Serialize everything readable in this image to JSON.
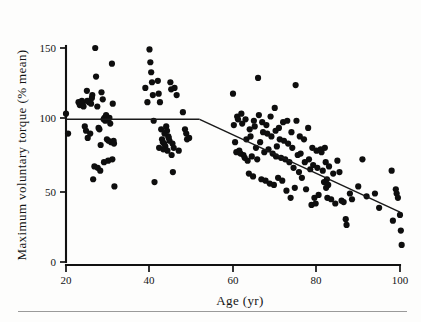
{
  "figure": {
    "background_color": "#fdfdfc",
    "ink_color": "#111111",
    "footer_rule": true
  },
  "axes": {
    "x_title": "Age (yr)",
    "y_title": "Maximum voluntary torque (% mean)",
    "x_ticks": [
      "20",
      "40",
      "60",
      "80",
      "100"
    ],
    "y_ticks": [
      "0",
      "50",
      "100",
      "150"
    ]
  },
  "chart_data": {
    "type": "scatter",
    "title": "",
    "xlabel": "Age (yr)",
    "ylabel": "Maximum voluntary torque (% mean)",
    "xlim": [
      20,
      100
    ],
    "ylim": [
      0,
      150
    ],
    "xticks": [
      20,
      40,
      60,
      80,
      100
    ],
    "yticks": [
      0,
      50,
      100,
      150
    ],
    "grid": false,
    "legend": null,
    "marker": {
      "shape": "filled-circle",
      "color": "#0e0e0e",
      "size": 3.1
    },
    "series": [
      {
        "name": "Maximum voluntary torque",
        "points": [
          [
            20,
            104
          ],
          [
            20.5,
            90
          ],
          [
            23,
            112
          ],
          [
            23.3,
            110
          ],
          [
            23.8,
            113
          ],
          [
            24,
            111
          ],
          [
            24.2,
            109
          ],
          [
            24.5,
            95
          ],
          [
            24.8,
            92
          ],
          [
            25,
            120
          ],
          [
            25.2,
            87
          ],
          [
            25.5,
            112
          ],
          [
            25.8,
            90
          ],
          [
            26,
            111
          ],
          [
            26.3,
            117
          ],
          [
            26.5,
            58
          ],
          [
            26.8,
            67
          ],
          [
            27,
            150
          ],
          [
            27.2,
            130
          ],
          [
            27.5,
            109
          ],
          [
            27.8,
            94
          ],
          [
            28,
            93
          ],
          [
            28.3,
            82
          ],
          [
            28.5,
            119
          ],
          [
            28.8,
            114
          ],
          [
            29,
            100
          ],
          [
            29.2,
            101
          ],
          [
            29.4,
            99
          ],
          [
            29.6,
            103
          ],
          [
            29.8,
            86
          ],
          [
            30,
            100
          ],
          [
            30.2,
            85
          ],
          [
            30.4,
            101
          ],
          [
            30.6,
            97
          ],
          [
            30.8,
            84
          ],
          [
            31,
            139
          ],
          [
            31.2,
            111
          ],
          [
            31.4,
            85
          ],
          [
            31.6,
            53
          ],
          [
            27.6,
            66
          ],
          [
            28.2,
            64
          ],
          [
            29.1,
            70
          ],
          [
            30.1,
            71
          ],
          [
            31.1,
            72
          ],
          [
            31.5,
            83
          ],
          [
            26.2,
            115
          ],
          [
            25.1,
            113
          ],
          [
            39,
            122
          ],
          [
            39.5,
            112
          ],
          [
            40,
            149
          ],
          [
            40.2,
            140
          ],
          [
            40.4,
            133
          ],
          [
            40.6,
            126
          ],
          [
            40.8,
            117
          ],
          [
            41,
            99
          ],
          [
            41.2,
            56
          ],
          [
            42,
            127
          ],
          [
            42.2,
            118
          ],
          [
            42.5,
            112
          ],
          [
            42.8,
            93
          ],
          [
            43,
            86
          ],
          [
            43.2,
            84
          ],
          [
            43.5,
            83
          ],
          [
            43.8,
            81
          ],
          [
            44,
            95
          ],
          [
            44.2,
            92
          ],
          [
            44.5,
            88
          ],
          [
            44.8,
            85
          ],
          [
            45,
            126
          ],
          [
            45.2,
            121
          ],
          [
            45.5,
            83
          ],
          [
            45.8,
            80
          ],
          [
            42.3,
            80
          ],
          [
            43.3,
            79
          ],
          [
            44.3,
            78
          ],
          [
            45.3,
            75
          ],
          [
            43.6,
            90
          ],
          [
            44.6,
            87
          ],
          [
            45.6,
            63
          ],
          [
            46,
            122
          ],
          [
            46.5,
            117
          ],
          [
            47,
            78
          ],
          [
            48,
            105
          ],
          [
            48.5,
            93
          ],
          [
            48.8,
            90
          ],
          [
            49,
            86
          ],
          [
            49.5,
            87
          ],
          [
            60,
            118
          ],
          [
            60.2,
            96
          ],
          [
            60.5,
            84
          ],
          [
            60.8,
            77
          ],
          [
            61,
            102
          ],
          [
            61.2,
            100
          ],
          [
            61.5,
            78
          ],
          [
            61.8,
            76
          ],
          [
            62,
            104
          ],
          [
            62.2,
            97
          ],
          [
            62.5,
            75
          ],
          [
            62.8,
            73
          ],
          [
            63,
            100
          ],
          [
            63.2,
            86
          ],
          [
            63.5,
            71
          ],
          [
            63.8,
            62
          ],
          [
            64,
            93
          ],
          [
            64.2,
            88
          ],
          [
            64.5,
            74
          ],
          [
            64.8,
            60
          ],
          [
            65,
            99
          ],
          [
            65.2,
            95
          ],
          [
            65.5,
            80
          ],
          [
            65.8,
            72
          ],
          [
            66,
            129
          ],
          [
            66.2,
            103
          ],
          [
            66.5,
            84
          ],
          [
            66.8,
            58
          ],
          [
            67,
            98
          ],
          [
            67.2,
            91
          ],
          [
            67.5,
            77
          ],
          [
            67.8,
            57
          ],
          [
            68,
            96
          ],
          [
            68.2,
            90
          ],
          [
            68.5,
            79
          ],
          [
            68.8,
            55
          ],
          [
            69,
            102
          ],
          [
            69.2,
            88
          ],
          [
            69.5,
            76
          ],
          [
            69.8,
            54
          ],
          [
            70,
            108
          ],
          [
            70.2,
            92
          ],
          [
            70.5,
            81
          ],
          [
            70.8,
            59
          ],
          [
            70.3,
            74
          ],
          [
            71,
            94
          ],
          [
            71.2,
            86
          ],
          [
            71.5,
            73
          ],
          [
            71.8,
            57
          ],
          [
            72,
            98
          ],
          [
            72.2,
            85
          ],
          [
            72.5,
            72
          ],
          [
            72.8,
            50
          ],
          [
            73,
            99
          ],
          [
            73.2,
            83
          ],
          [
            73.5,
            70
          ],
          [
            73.8,
            45
          ],
          [
            74,
            91
          ],
          [
            74.2,
            80
          ],
          [
            74.5,
            66
          ],
          [
            74.8,
            52
          ],
          [
            75,
            124
          ],
          [
            75.2,
            99
          ],
          [
            75.5,
            75
          ],
          [
            75.8,
            63
          ],
          [
            76,
            88
          ],
          [
            76.2,
            76
          ],
          [
            76.5,
            59
          ],
          [
            77,
            86
          ],
          [
            77.2,
            70
          ],
          [
            77.5,
            51
          ],
          [
            78,
            94
          ],
          [
            78.2,
            72
          ],
          [
            78.5,
            65
          ],
          [
            78.8,
            40
          ],
          [
            79,
            80
          ],
          [
            79.2,
            68
          ],
          [
            79.5,
            45
          ],
          [
            79.8,
            41
          ],
          [
            80,
            78
          ],
          [
            80.2,
            66
          ],
          [
            80.5,
            47
          ],
          [
            81,
            79
          ],
          [
            81.2,
            77
          ],
          [
            81.5,
            64
          ],
          [
            81.8,
            56
          ],
          [
            82,
            80
          ],
          [
            82.2,
            70
          ],
          [
            82.5,
            58
          ],
          [
            82.8,
            54
          ],
          [
            82.3,
            52
          ],
          [
            82.6,
            45
          ],
          [
            83,
            67
          ],
          [
            83.5,
            44
          ],
          [
            84,
            62
          ],
          [
            84.5,
            41
          ],
          [
            85,
            71
          ],
          [
            85.5,
            63
          ],
          [
            86,
            43
          ],
          [
            86.5,
            42
          ],
          [
            87,
            30
          ],
          [
            87.2,
            26
          ],
          [
            88,
            48
          ],
          [
            88.5,
            44
          ],
          [
            90,
            53
          ],
          [
            91,
            72
          ],
          [
            92,
            46
          ],
          [
            94,
            48
          ],
          [
            95,
            38
          ],
          [
            98,
            64
          ],
          [
            98.3,
            29
          ],
          [
            99,
            51
          ],
          [
            99.2,
            48
          ],
          [
            99.5,
            45
          ],
          [
            100,
            33
          ],
          [
            100.2,
            22
          ],
          [
            100.4,
            12
          ]
        ]
      }
    ],
    "fitted_lines": [
      {
        "name": "plateau-segment",
        "style": "solid",
        "x_start": 20,
        "y_start": 100,
        "x_end": 52,
        "y_end": 100
      },
      {
        "name": "decline-segment",
        "style": "solid",
        "x_start": 52,
        "y_start": 100,
        "x_end": 100,
        "y_end": 35
      }
    ]
  }
}
